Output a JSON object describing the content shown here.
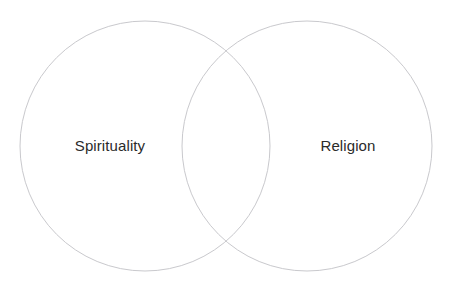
{
  "canvas": {
    "width": 453,
    "height": 285,
    "background_color": "#ffffff"
  },
  "diagram": {
    "type": "venn",
    "set_count": 2,
    "stroke_color": "#c9c9cd",
    "stroke_width": 1,
    "fill": "none",
    "text_color": "#2b2b2b",
    "font_size": 15
  },
  "sets": [
    {
      "id": "left",
      "label": "Spirituality",
      "center_x": 145,
      "center_y": 146,
      "radius": 125,
      "label_x": 110,
      "label_y": 147
    },
    {
      "id": "right",
      "label": "Religion",
      "center_x": 307,
      "center_y": 146,
      "radius": 125,
      "label_x": 348,
      "label_y": 147
    }
  ],
  "intersection": {
    "label": "",
    "center_x": 226,
    "center_y": 146
  }
}
